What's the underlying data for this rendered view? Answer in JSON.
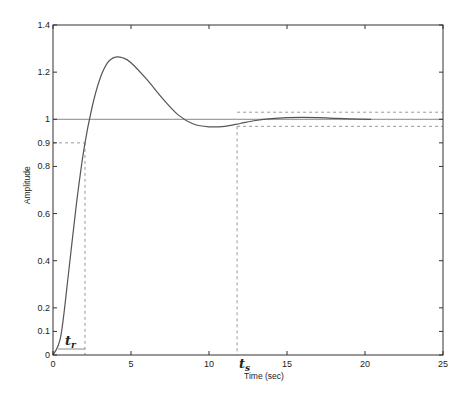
{
  "chart_data": {
    "type": "line",
    "title": "",
    "xlabel": "Time (sec)",
    "ylabel": "Amplitude",
    "xlim": [
      0,
      25
    ],
    "ylim": [
      0,
      1.4
    ],
    "grid": false,
    "xticks": [
      0,
      5,
      10,
      15,
      20,
      25
    ],
    "xtick_labels": [
      "0",
      "5",
      "10",
      "15",
      "20",
      "25"
    ],
    "yticks": [
      0,
      0.1,
      0.2,
      0.4,
      0.6,
      0.8,
      0.9,
      1,
      1.2,
      1.4
    ],
    "ytick_labels": [
      "0",
      "0.1",
      "0.2",
      "0.4",
      "0.6",
      "0.8",
      "0.9",
      "1",
      "1.2",
      "1.4"
    ],
    "series": [
      {
        "name": "Step response",
        "x": [
          0,
          0.5,
          1.0,
          1.5,
          2.0,
          2.5,
          3.0,
          3.5,
          4.0,
          4.5,
          5.0,
          6.0,
          7.0,
          8.0,
          9.0,
          10.0,
          11.0,
          12.0,
          13.0,
          14.0,
          15.0,
          16.0,
          17.0,
          18.0,
          19.0,
          20.4
        ],
        "y": [
          0,
          0.08,
          0.35,
          0.64,
          0.88,
          1.05,
          1.17,
          1.24,
          1.264,
          1.26,
          1.24,
          1.17,
          1.09,
          1.02,
          0.98,
          0.968,
          0.97,
          0.982,
          0.995,
          1.003,
          1.007,
          1.008,
          1.007,
          1.004,
          1.002,
          1.0
        ]
      }
    ],
    "reference_lines": {
      "final_value": 1.0,
      "upper_band": 1.03,
      "lower_band": 0.97,
      "ninety_percent": 0.9,
      "rise_time_end": 2.05,
      "settling_time": 11.8,
      "band_start_x": 11.8
    },
    "annotations": [
      {
        "text": "t",
        "sub": "r",
        "meaning": "rise time",
        "x": 1.2,
        "y": 0.05
      },
      {
        "text": "t",
        "sub": "s",
        "meaning": "settling time",
        "x": 12.4,
        "y": -0.05
      }
    ]
  },
  "labels": {
    "xlabel": "Time (sec)",
    "ylabel": "Amplitude",
    "tr_main": "t",
    "tr_sub": "r",
    "ts_main": "t",
    "ts_sub": "s"
  },
  "colors": {
    "curve": "#555555",
    "axis": "#333333",
    "reference": "#888888",
    "dashed": "#999999"
  }
}
